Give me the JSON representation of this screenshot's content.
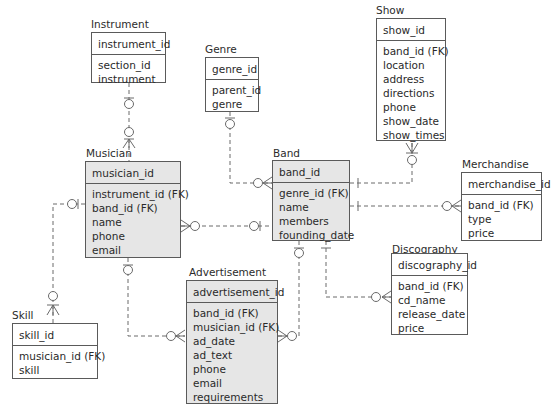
{
  "diagram": {
    "type": "entity-relationship",
    "entities": {
      "instrument": {
        "title": "Instrument",
        "pk": "instrument_id",
        "attrs": [
          "section_id",
          "instrument"
        ]
      },
      "genre": {
        "title": "Genre",
        "pk": "genre_id",
        "attrs": [
          "parent_id",
          "genre"
        ]
      },
      "show": {
        "title": "Show",
        "pk": "show_id",
        "attrs": [
          "band_id (FK)",
          "location",
          "address",
          "directions",
          "phone",
          "show_date",
          "show_times"
        ]
      },
      "musician": {
        "title": "Musician",
        "pk": "musician_id",
        "attrs": [
          "instrument_id (FK)",
          "band_id (FK)",
          "name",
          "phone",
          "email"
        ]
      },
      "band": {
        "title": "Band",
        "pk": "band_id",
        "attrs": [
          "genre_id (FK)",
          "name",
          "members",
          "founding_date"
        ]
      },
      "merchandise": {
        "title": "Merchandise",
        "pk": "merchandise_id",
        "attrs": [
          "band_id (FK)",
          "type",
          "price"
        ]
      },
      "discography": {
        "title": "Discography",
        "pk": "discography_id",
        "attrs": [
          "band_id (FK)",
          "cd_name",
          "release_date",
          "price"
        ]
      },
      "advertisement": {
        "title": "Advertisement",
        "pk": "advertisement_id",
        "attrs": [
          "band_id (FK)",
          "musician_id (FK)",
          "ad_date",
          "ad_text",
          "phone",
          "email",
          "requirements"
        ]
      },
      "skill": {
        "title": "Skill",
        "pk": "skill_id",
        "attrs": [
          "musician_id (FK)",
          "skill"
        ]
      }
    },
    "relationships": [
      {
        "from": "Instrument",
        "to": "Musician",
        "from_card": "zero-or-one",
        "to_card": "zero-or-many"
      },
      {
        "from": "Genre",
        "to": "Band",
        "from_card": "zero-or-one",
        "to_card": "zero-or-many"
      },
      {
        "from": "Band",
        "to": "Show",
        "from_card": "exactly-one",
        "to_card": "zero-or-many"
      },
      {
        "from": "Band",
        "to": "Merchandise",
        "from_card": "exactly-one",
        "to_card": "zero-or-many"
      },
      {
        "from": "Band",
        "to": "Musician",
        "from_card": "zero-or-one",
        "to_card": "zero-or-many"
      },
      {
        "from": "Band",
        "to": "Discography",
        "from_card": "exactly-one",
        "to_card": "zero-or-many"
      },
      {
        "from": "Band",
        "to": "Advertisement",
        "from_card": "zero-or-one",
        "to_card": "zero-or-many"
      },
      {
        "from": "Musician",
        "to": "Advertisement",
        "from_card": "zero-or-one",
        "to_card": "zero-or-many"
      },
      {
        "from": "Musician",
        "to": "Skill",
        "from_card": "zero-or-one",
        "to_card": "zero-or-many"
      }
    ],
    "colors": {
      "shaded_entity": "#e6e6e6",
      "border": "#5a5a5a",
      "line": "#6a6a6a"
    }
  }
}
